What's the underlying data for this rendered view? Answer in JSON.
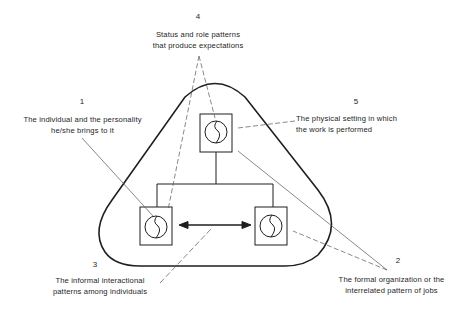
{
  "diagram": {
    "type": "organizational-factors-triangle",
    "labels": [
      {
        "id": "1",
        "number": "1",
        "line1": "The individual and the personality",
        "line2": "he/she brings to it"
      },
      {
        "id": "2",
        "number": "2",
        "line1": "The formal organization or the",
        "line2": "interrelated pattern of jobs"
      },
      {
        "id": "3",
        "number": "3",
        "line1": "The informal interactional",
        "line2": "patterns among individuals"
      },
      {
        "id": "4",
        "number": "4",
        "line1": "Status and role patterns",
        "line2": "that produce expectations"
      },
      {
        "id": "5",
        "number": "5",
        "line1": "The physical setting in which",
        "line2": "the work is performed"
      }
    ],
    "nodes": [
      {
        "id": "top-person",
        "icon": "person-in-box"
      },
      {
        "id": "bottom-left-person",
        "icon": "person-in-box"
      },
      {
        "id": "bottom-right-person",
        "icon": "person-in-box"
      }
    ],
    "connectors": [
      {
        "from": "top-person",
        "to": [
          "bottom-left-person",
          "bottom-right-person"
        ],
        "style": "solid-org-chart"
      },
      {
        "from": "bottom-left-person",
        "to": "bottom-right-person",
        "style": "double-arrow"
      }
    ],
    "colors": {
      "ink": "#1e1e1e",
      "leader": "#555555",
      "background": "#ffffff"
    }
  }
}
